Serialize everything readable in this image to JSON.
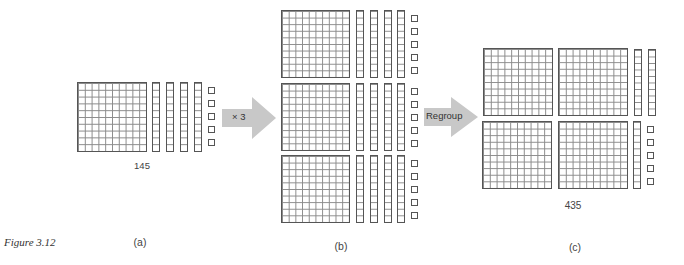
{
  "figure": {
    "caption": "Figure 3.12",
    "colors": {
      "block_stroke": "#555555",
      "grid_line": "#8a8a8a",
      "arrow_fill": "#c8c8c8"
    }
  },
  "panels": [
    {
      "id": "a",
      "label": "(a)",
      "value_label": "145",
      "hundreds": 1,
      "tens": 4,
      "ones": 5
    },
    {
      "id": "b",
      "label": "(b)",
      "value_label": "",
      "hundreds": 3,
      "tens": 12,
      "ones": 15,
      "rows": [
        {
          "hundreds": 1,
          "tens": 4,
          "ones": 5
        },
        {
          "hundreds": 1,
          "tens": 4,
          "ones": 5
        },
        {
          "hundreds": 1,
          "tens": 4,
          "ones": 5
        }
      ]
    },
    {
      "id": "c",
      "label": "(c)",
      "value_label": "435",
      "hundreds": 4,
      "tens": 3,
      "ones": 5
    }
  ],
  "arrows": [
    {
      "id": "multiply",
      "label": "× 3"
    },
    {
      "id": "regroup",
      "label": "Regroup"
    }
  ]
}
